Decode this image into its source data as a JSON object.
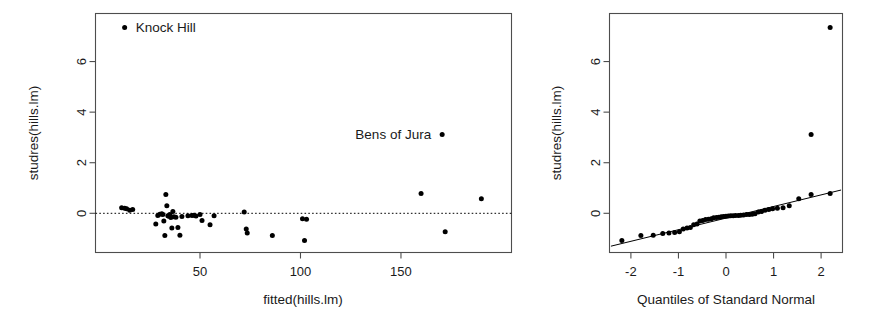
{
  "figure": {
    "background": "#ffffff",
    "foreground": "#1a1a1a",
    "point_color": "#000000",
    "frame_color": "#4d4d4d"
  },
  "chart_data": [
    {
      "type": "scatter",
      "panel": "left",
      "title": "",
      "xlabel": "fitted(hills.lm)",
      "ylabel": "studres(hills.lm)",
      "xlim": [
        -2,
        205
      ],
      "ylim": [
        -1.55,
        7.9
      ],
      "xticks": [
        50,
        100,
        150
      ],
      "xticklabels": [
        "50",
        "100",
        "150"
      ],
      "yticks": [
        0,
        2,
        4,
        6
      ],
      "yticklabels": [
        "0",
        "2",
        "4",
        "6"
      ],
      "grid": false,
      "legend": null,
      "hlines": [
        {
          "y": 0,
          "style": "dotted"
        }
      ],
      "annotations": [
        {
          "text": "Knock Hill",
          "x": 12.5,
          "y": 7.35,
          "anchor": "left",
          "dx": 11,
          "dy": 4.5
        },
        {
          "text": "Bens of Jura",
          "x": 170.5,
          "y": 3.12,
          "anchor": "right",
          "dx": -11,
          "dy": 4.5
        }
      ],
      "x": [
        11.0,
        12.5,
        13.5,
        15.0,
        16.5,
        28.0,
        29.0,
        30.0,
        31.0,
        31.5,
        32.0,
        32.5,
        33.0,
        33.5,
        34.0,
        34.5,
        35.0,
        35.5,
        36.0,
        36.5,
        37.0,
        38.0,
        39.0,
        40.0,
        41.0,
        44.0,
        46.0,
        47.0,
        48.0,
        50.0,
        51.0,
        55.0,
        57.0,
        72.0,
        73.0,
        73.5,
        86.0,
        101.0,
        102.0,
        103.0,
        160.0,
        170.5,
        172.0,
        190.0
      ],
      "y": [
        0.22,
        0.2,
        0.18,
        0.12,
        0.15,
        -0.42,
        -0.09,
        -0.04,
        -0.02,
        -0.05,
        -0.3,
        -0.88,
        0.74,
        0.3,
        -0.1,
        -0.12,
        -0.05,
        -0.17,
        -0.58,
        0.07,
        -0.14,
        -0.16,
        -0.56,
        -0.87,
        -0.13,
        -0.1,
        -0.09,
        -0.08,
        -0.11,
        -0.05,
        -0.28,
        -0.45,
        -0.1,
        0.05,
        -0.62,
        -0.78,
        -0.88,
        -0.22,
        -1.08,
        -0.24,
        0.78,
        3.12,
        -0.73,
        0.58
      ],
      "extra_points": [
        {
          "x": 12.5,
          "y": 7.35,
          "label": "Knock Hill"
        }
      ]
    },
    {
      "type": "scatter",
      "panel": "right",
      "title": "",
      "xlabel": "Quantiles of Standard Normal",
      "ylabel": "studres(hills.lm)",
      "xlim": [
        -2.45,
        2.45
      ],
      "ylim": [
        -1.55,
        7.9
      ],
      "xticks": [
        -2,
        -1,
        0,
        1,
        2
      ],
      "xticklabels": [
        "-2",
        "-1",
        "0",
        "1",
        "2"
      ],
      "yticks": [
        0,
        2,
        4,
        6
      ],
      "yticklabels": [
        "0",
        "2",
        "4",
        "6"
      ],
      "grid": false,
      "legend": null,
      "refline": {
        "x0": -2.42,
        "y0": -1.3,
        "x1": 2.42,
        "y1": 0.92
      },
      "x": [
        -2.19,
        -1.79,
        -1.53,
        -1.33,
        -1.2,
        -1.08,
        -0.98,
        -0.9,
        -0.82,
        -0.75,
        -0.68,
        -0.61,
        -0.55,
        -0.49,
        -0.43,
        -0.37,
        -0.31,
        -0.26,
        -0.2,
        -0.15,
        -0.1,
        -0.05,
        0.0,
        0.05,
        0.1,
        0.15,
        0.2,
        0.26,
        0.31,
        0.37,
        0.43,
        0.49,
        0.55,
        0.61,
        0.68,
        0.75,
        0.82,
        0.9,
        0.98,
        1.08,
        1.2,
        1.33,
        1.53,
        1.79,
        2.19
      ],
      "y": [
        -1.08,
        -0.88,
        -0.87,
        -0.8,
        -0.78,
        -0.76,
        -0.73,
        -0.62,
        -0.58,
        -0.56,
        -0.45,
        -0.42,
        -0.3,
        -0.28,
        -0.25,
        -0.24,
        -0.22,
        -0.18,
        -0.17,
        -0.16,
        -0.14,
        -0.13,
        -0.12,
        -0.11,
        -0.1,
        -0.1,
        -0.09,
        -0.09,
        -0.08,
        -0.07,
        -0.05,
        -0.05,
        -0.04,
        -0.02,
        0.05,
        0.07,
        0.12,
        0.15,
        0.18,
        0.2,
        0.22,
        0.3,
        0.58,
        0.74,
        0.78
      ],
      "outliers": [
        {
          "x": 1.79,
          "y": 3.12,
          "label": "Bens of Jura"
        },
        {
          "x": 2.19,
          "y": 7.35,
          "label": "Knock Hill"
        }
      ]
    }
  ]
}
